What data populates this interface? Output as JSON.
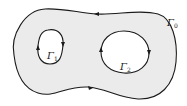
{
  "diagram": {
    "fill_color": "#ebebeb",
    "stroke_color": "#1a1a1a",
    "curves": [
      {
        "id": "outer",
        "label": "Γ",
        "subscript": "0",
        "orientation": "counterclockwise"
      },
      {
        "id": "hole1",
        "label": "Γ",
        "subscript": "1",
        "orientation": "clockwise"
      },
      {
        "id": "hole2",
        "label": "Γ",
        "subscript": "2",
        "orientation": "clockwise"
      }
    ]
  }
}
